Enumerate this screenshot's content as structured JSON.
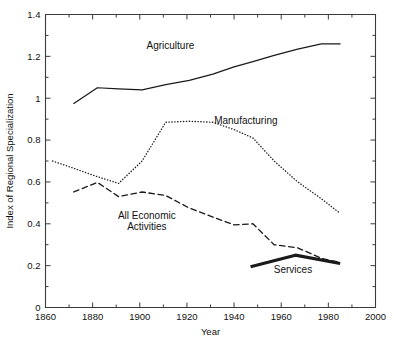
{
  "chart_data": {
    "type": "line",
    "title": "",
    "xlabel": "Year",
    "ylabel": "Index of Regional Specialization",
    "xlim": [
      1860,
      2000
    ],
    "ylim": [
      0,
      1.4
    ],
    "grid": false,
    "legend_position": "inline-annotations",
    "x_ticks": [
      1860,
      1880,
      1900,
      1920,
      1940,
      1960,
      1980,
      2000
    ],
    "x_tick_labels": [
      "1860",
      "1880",
      "1900",
      "1920",
      "1940",
      "1960",
      "1980",
      "2000"
    ],
    "x_minor_ticks": [
      1870,
      1890,
      1910,
      1930,
      1950,
      1970,
      1990
    ],
    "y_ticks": [
      0,
      0.2,
      0.4,
      0.6,
      0.8,
      1,
      1.2,
      1.4
    ],
    "y_tick_labels": [
      "0",
      "0.2",
      "0.4",
      "0.6",
      "0.8",
      "1",
      "1.2",
      "1.4"
    ],
    "y_minor_ticks": [
      0.1,
      0.3,
      0.5,
      0.7,
      0.9,
      1.1,
      1.3
    ],
    "series": [
      {
        "name": "Agriculture",
        "style": "solid",
        "label_x": 1913,
        "label_y": 1.235,
        "x": [
          1872,
          1882,
          1891,
          1901,
          1911,
          1921,
          1931,
          1940,
          1948,
          1957,
          1967,
          1977,
          1985
        ],
        "values": [
          0.975,
          1.05,
          1.045,
          1.04,
          1.065,
          1.085,
          1.115,
          1.15,
          1.175,
          1.205,
          1.235,
          1.26,
          1.26
        ]
      },
      {
        "name": "Manufacturing",
        "style": "dotted",
        "label_x": 1945,
        "label_y": 0.875,
        "x": [
          1863,
          1872,
          1882,
          1891,
          1901,
          1911,
          1921,
          1931,
          1940,
          1948,
          1957,
          1967,
          1977,
          1985
        ],
        "values": [
          0.7,
          0.665,
          0.625,
          0.593,
          0.7,
          0.885,
          0.89,
          0.885,
          0.85,
          0.81,
          0.7,
          0.6,
          0.52,
          0.45
        ]
      },
      {
        "name": "All Economic Activities",
        "style": "dashed",
        "label_x": 1903,
        "label_y": 0.425,
        "label_lines": [
          "All Economic",
          "Activities"
        ],
        "x": [
          1872,
          1882,
          1891,
          1901,
          1911,
          1921,
          1931,
          1940,
          1948,
          1957,
          1967,
          1977,
          1985
        ],
        "values": [
          0.552,
          0.598,
          0.53,
          0.552,
          0.535,
          0.475,
          0.432,
          0.395,
          0.4,
          0.3,
          0.285,
          0.235,
          0.215
        ]
      },
      {
        "name": "Services",
        "style": "thick-solid",
        "label_x": 1965,
        "label_y": 0.165,
        "x": [
          1947,
          1966,
          1985
        ],
        "values": [
          0.195,
          0.25,
          0.21
        ]
      }
    ]
  },
  "axes": {
    "x_axis_title": "Year",
    "y_axis_title": "Index of Regional Specialization"
  }
}
